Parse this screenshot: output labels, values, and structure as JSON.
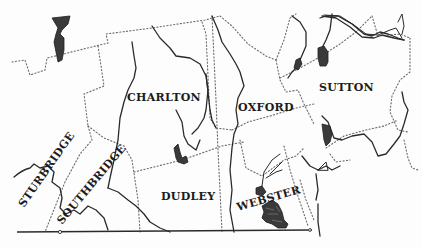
{
  "map": {
    "type": "town boundary map",
    "style": "black-and-white line drawing",
    "colors": {
      "background": "#fdfdfd",
      "ink": "#1c1c1c",
      "boundary": "#6a6a6a",
      "water": "#3a3a3a"
    },
    "towns": [
      {
        "id": "sturbridge",
        "label": "STURBRIDGE"
      },
      {
        "id": "charlton",
        "label": "CHARLTON"
      },
      {
        "id": "southbridge",
        "label": "SOUTHBRIDGE"
      },
      {
        "id": "dudley",
        "label": "DUDLEY"
      },
      {
        "id": "oxford",
        "label": "OXFORD"
      },
      {
        "id": "sutton",
        "label": "SUTTON"
      },
      {
        "id": "webster",
        "label": "WEBSTER"
      }
    ],
    "legend_symbols": {
      "town_boundary": "dotted line",
      "river": "solid line",
      "lake": "dark filled shape",
      "state_line": "solid horizontal line at bottom"
    }
  }
}
